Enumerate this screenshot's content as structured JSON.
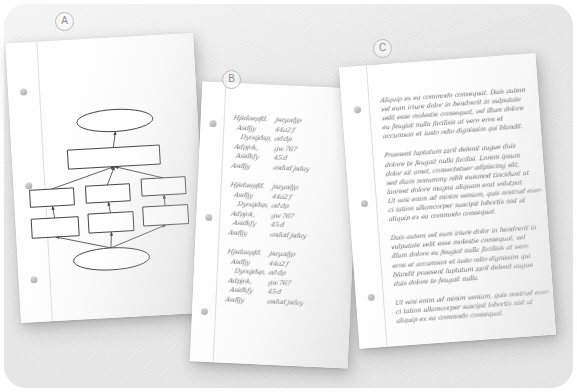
{
  "scene": {
    "title": "Three annotated paper documents on a gray surface",
    "background_color": "#e9e9e9",
    "paper_color": "#fdfdfd"
  },
  "labels": {
    "a": "A",
    "b": "B",
    "c": "C"
  },
  "documents": [
    {
      "id": "a",
      "label": "A",
      "type": "diagram",
      "description": "Hand-drawn flowchart on lined notebook paper"
    },
    {
      "id": "b",
      "label": "B",
      "type": "handwritten-list",
      "description": "Handwritten key/value record entries"
    },
    {
      "id": "c",
      "label": "C",
      "type": "handwritten-text",
      "description": "Handwritten lorem ipsum paragraphs"
    }
  ],
  "flowchart": {
    "type": "diagram",
    "shapes": [
      {
        "name": "start-terminator",
        "shape": "ellipse",
        "cx": 105,
        "cy": 83,
        "rx": 38,
        "ry": 11
      },
      {
        "name": "process-top",
        "shape": "rect",
        "x": 56,
        "y": 110,
        "w": 92,
        "h": 19
      },
      {
        "name": "process-left-1",
        "shape": "rect",
        "x": 16,
        "y": 148,
        "w": 44,
        "h": 17
      },
      {
        "name": "process-mid-1",
        "shape": "rect",
        "x": 72,
        "y": 147,
        "w": 44,
        "h": 17
      },
      {
        "name": "process-right-1",
        "shape": "rect",
        "x": 128,
        "y": 143,
        "w": 44,
        "h": 17
      },
      {
        "name": "process-left-2",
        "shape": "rect",
        "x": 16,
        "y": 177,
        "w": 47,
        "h": 19
      },
      {
        "name": "process-mid-2",
        "shape": "rect",
        "x": 73,
        "y": 175,
        "w": 45,
        "h": 19
      },
      {
        "name": "process-right-2",
        "shape": "rect",
        "x": 128,
        "y": 171,
        "w": 45,
        "h": 19
      },
      {
        "name": "end-terminator",
        "shape": "ellipse",
        "cx": 94,
        "cy": 221,
        "rx": 38,
        "ry": 11
      }
    ],
    "edges": [
      {
        "from": "process-top",
        "to": "start-terminator"
      },
      {
        "from": "process-left-1",
        "to": "process-top"
      },
      {
        "from": "process-mid-1",
        "to": "process-top"
      },
      {
        "from": "process-right-1",
        "to": "process-top"
      },
      {
        "from": "process-left-2",
        "to": "process-left-1"
      },
      {
        "from": "process-mid-2",
        "to": "process-mid-1"
      },
      {
        "from": "process-right-2",
        "to": "process-right-1"
      },
      {
        "from": "end-terminator",
        "to": "process-left-2"
      },
      {
        "from": "end-terminator",
        "to": "process-mid-2"
      },
      {
        "from": "end-terminator",
        "to": "process-right-2"
      }
    ],
    "stroke_color": "#555555"
  },
  "list_document": {
    "block_count": 3,
    "blocks": [
      {
        "rows": [
          {
            "key": "Hjsdaepfd.",
            "value": "jsayadjp"
          },
          {
            "key": "Asdljy",
            "value": "44a2 f"
          },
          {
            "key": "Dyoajdsp,",
            "value": "ad dp"
          },
          {
            "key": "Adpjok,",
            "value": "gw 767"
          },
          {
            "key": "Asidkfy",
            "value": "45 d"
          },
          {
            "key": "Asdljy",
            "value": "asdad jsday"
          }
        ]
      },
      {
        "rows": [
          {
            "key": "Hjsdaepfd.",
            "value": "jsayadjp"
          },
          {
            "key": "Asdljy",
            "value": "44a2 f"
          },
          {
            "key": "Dyoajdsp,",
            "value": "ad dp"
          },
          {
            "key": "Adpjok,",
            "value": "gw 767"
          },
          {
            "key": "Asidkfy",
            "value": "45 d"
          },
          {
            "key": "Asdljy",
            "value": "asdad jsday"
          }
        ]
      },
      {
        "rows": [
          {
            "key": "Hjsdaepfd.",
            "value": "jsayadjp"
          },
          {
            "key": "Asdljy",
            "value": "44a2 f"
          },
          {
            "key": "Dyoajdsp,",
            "value": "ad dp"
          },
          {
            "key": "Adpjok,",
            "value": "gw 767"
          },
          {
            "key": "Asidkfy",
            "value": "45 d"
          },
          {
            "key": "Asdljy",
            "value": "asdad jsday"
          }
        ]
      }
    ]
  },
  "text_document": {
    "paragraphs": [
      {
        "lines": [
          "Aliquip ex ea commodo consequat. Duis autem",
          "vel eum iriure dolor in hendrerit in vulputate",
          "velit esse molestie consequat, vel illum dolore",
          "eu feugiat nulla facilisis at vero eros et",
          "accumsan et iusto odio dignissim qui blandit."
        ]
      },
      {
        "lines": [
          "Praesent luptatum zzril delenit augue duis",
          "dolore te feugait nulla facilisi. Lorem ipsum",
          "dolor sit amet, consectetuer adipiscing elit,",
          "sed diam nonummy nibh euismod tincidunt ut",
          "laoreet dolore magna aliquam erat volutpat.",
          "Ut wisi enim ad minim veniam, quis nostrud exer-",
          "ci tation ullamcorper suscipit lobortis nisl ut",
          "aliquip ex ea commodo consequat."
        ]
      },
      {
        "lines": [
          "Duis autem vel eum iriure dolor in hendrerit in",
          "vulputate velit esse molestie consequat, vel",
          "illum dolore eu feugiat nulla facilisis at vero",
          "eros et accumsan et iusto odio dignissim qui",
          "blandit praesent luptatum zzril delenit augue",
          "duis dolore te feugait nulla."
        ]
      },
      {
        "lines": [
          "Ut wisi enim ad minim veniam, quis nostrud exer-",
          "ci tation ullamcorper suscipit lobortis nisl ut",
          "aliquip ex ea commodo consequat."
        ]
      }
    ]
  }
}
